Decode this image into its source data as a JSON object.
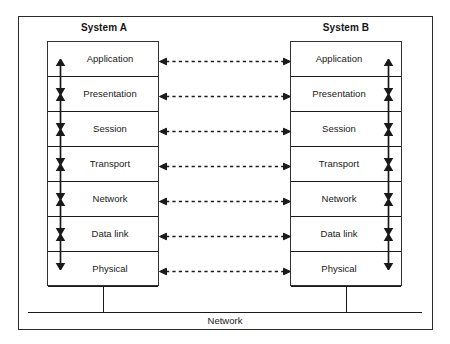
{
  "figure": {
    "bus_label": "Network",
    "frame_color": "#2b2b2b",
    "line_color": "#1a1a1a",
    "background_color": "#ffffff"
  },
  "systems": [
    {
      "id": "system-a",
      "title": "System A",
      "arrow_side": "left"
    },
    {
      "id": "system-b",
      "title": "System B",
      "arrow_side": "right"
    }
  ],
  "layers": [
    {
      "index": 7,
      "label": "Application"
    },
    {
      "index": 6,
      "label": "Presentation"
    },
    {
      "index": 5,
      "label": "Session"
    },
    {
      "index": 4,
      "label": "Transport"
    },
    {
      "index": 3,
      "label": "Network"
    },
    {
      "index": 2,
      "label": "Data link"
    },
    {
      "index": 1,
      "label": "Physical"
    }
  ],
  "peer_links": [
    {
      "layer": "Application",
      "style": "dashed",
      "heads": "both"
    },
    {
      "layer": "Presentation",
      "style": "dashed",
      "heads": "both"
    },
    {
      "layer": "Session",
      "style": "dashed",
      "heads": "both"
    },
    {
      "layer": "Transport",
      "style": "dashed",
      "heads": "both"
    },
    {
      "layer": "Network",
      "style": "dashed",
      "heads": "both"
    },
    {
      "layer": "Data link",
      "style": "dashed",
      "heads": "both"
    },
    {
      "layer": "Physical",
      "style": "dashed",
      "heads": "both"
    }
  ],
  "intra_links": [
    {
      "between": "Application-Presentation",
      "style": "solid",
      "heads": "both"
    },
    {
      "between": "Presentation-Session",
      "style": "solid",
      "heads": "both"
    },
    {
      "between": "Session-Transport",
      "style": "solid",
      "heads": "both"
    },
    {
      "between": "Transport-Network",
      "style": "solid",
      "heads": "both"
    },
    {
      "between": "Network-Data link",
      "style": "solid",
      "heads": "both"
    },
    {
      "between": "Data link-Physical",
      "style": "solid",
      "heads": "both"
    }
  ]
}
